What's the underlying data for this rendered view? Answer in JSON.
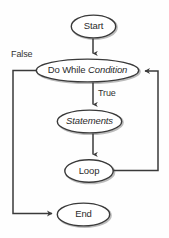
{
  "diagram": {
    "type": "flowchart",
    "background_color": "#fefefe",
    "line_color": "#3a3a3a",
    "text_color": "#2b2b2b",
    "shadow_color": "#b9b9b9",
    "nodes": [
      {
        "id": "start",
        "shape": "ellipse",
        "label": "Start",
        "label_plain": "Start",
        "italic": false
      },
      {
        "id": "condition",
        "shape": "ellipse",
        "label_prefix": "Do While ",
        "label_italic": "Condition",
        "label_plain": "Do While Condition",
        "italic": "partial"
      },
      {
        "id": "statements",
        "shape": "ellipse",
        "label": "Statements",
        "label_plain": "Statements",
        "italic": true
      },
      {
        "id": "loop",
        "shape": "ellipse",
        "label": "Loop",
        "label_plain": "Loop",
        "italic": false
      },
      {
        "id": "end",
        "shape": "ellipse",
        "label": "End",
        "label_plain": "End",
        "italic": false
      }
    ],
    "edge_labels": [
      {
        "id": "false-label",
        "text": "False"
      },
      {
        "id": "true-label",
        "text": "True"
      }
    ],
    "edges": [
      {
        "from": "start",
        "to": "condition",
        "label": "",
        "style": "straight-down"
      },
      {
        "from": "condition",
        "to": "statements",
        "label": "True",
        "style": "straight-down"
      },
      {
        "from": "statements",
        "to": "loop",
        "label": "",
        "style": "straight-down"
      },
      {
        "from": "loop",
        "to": "condition",
        "label": "",
        "style": "right-up-loopback"
      },
      {
        "from": "condition",
        "to": "end",
        "label": "False",
        "style": "left-down-branch"
      }
    ]
  }
}
